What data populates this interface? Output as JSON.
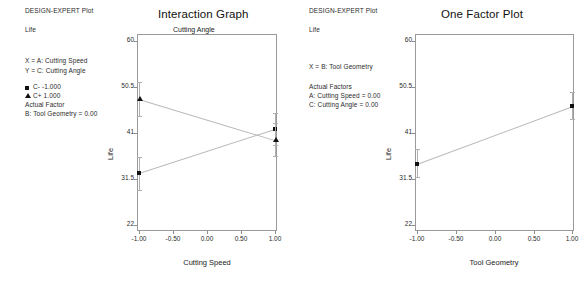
{
  "software": {
    "header_label": "DESIGN-EXPERT Plot",
    "response_label": "Life"
  },
  "left_panel": {
    "header": "DESIGN-EXPERT Plot",
    "response": "Life",
    "x_spec": "X = A: Cutting Speed",
    "y_spec": "Y = C: Cutting Angle",
    "legend": [
      {
        "marker": "square-marker-icon",
        "label": "C- -1.000"
      },
      {
        "marker": "triangle-marker-icon",
        "label": "C+ 1.000"
      }
    ],
    "actual_factor_heading": "Actual Factor",
    "actual_factors": [
      "B: Tool Geometry = 0.00"
    ],
    "title": "Interaction Graph",
    "subtitle": "Cutting Angle",
    "xlabel": "Cutting Speed",
    "ylabel": "Life",
    "yticks": [
      "60",
      "50.5",
      "41",
      "31.5",
      "22"
    ],
    "xticks": [
      "-1.00",
      "-0.50",
      "0.00",
      "0.50",
      "1.00"
    ]
  },
  "right_panel": {
    "header": "DESIGN-EXPERT Plot",
    "response": "Life",
    "x_spec": "X = B: Tool Geometry",
    "actual_factor_heading": "Actual Factors",
    "actual_factors": [
      "A: Cutting Speed = 0.00",
      "C: Cutting Angle = 0.00"
    ],
    "title": "One Factor Plot",
    "xlabel": "Tool Geometry",
    "ylabel": "Life",
    "yticks": [
      "60",
      "50.5",
      "41",
      "31.5",
      "22"
    ],
    "xticks": [
      "-1.00",
      "-0.50",
      "0.00",
      "0.50",
      "1.00"
    ]
  },
  "chart_data": [
    {
      "type": "line",
      "title": "Interaction Graph",
      "subtitle": "Cutting Angle",
      "xlabel": "Cutting Speed",
      "ylabel": "Life",
      "xlim": [
        -1.0,
        1.0
      ],
      "ylim": [
        22,
        60
      ],
      "yticks": [
        60,
        50.5,
        41,
        31.5,
        22
      ],
      "xticks": [
        -1.0,
        -0.5,
        0.0,
        0.5,
        1.0
      ],
      "grid": false,
      "legend_position": "outside-left",
      "x": [
        -1.0,
        1.0
      ],
      "series": [
        {
          "name": "C- -1.000",
          "marker": "square",
          "values": [
            32.7,
            41.8
          ],
          "err_low": [
            29.3,
            38.5
          ],
          "err_high": [
            36.1,
            45.2
          ]
        },
        {
          "name": "C+ 1.000",
          "marker": "triangle",
          "values": [
            48.1,
            39.6
          ],
          "err_low": [
            44.6,
            36.2
          ],
          "err_high": [
            51.6,
            43.1
          ]
        }
      ]
    },
    {
      "type": "line",
      "title": "One Factor Plot",
      "xlabel": "Tool Geometry",
      "ylabel": "Life",
      "xlim": [
        -1.0,
        1.0
      ],
      "ylim": [
        22,
        60
      ],
      "yticks": [
        60,
        50.5,
        41,
        31.5,
        22
      ],
      "xticks": [
        -1.0,
        -0.5,
        0.0,
        0.5,
        1.0
      ],
      "grid": false,
      "legend_position": "none",
      "x": [
        -1.0,
        1.0
      ],
      "series": [
        {
          "name": "Life",
          "marker": "square",
          "values": [
            34.7,
            46.6
          ],
          "err_low": [
            31.9,
            43.8
          ],
          "err_high": [
            37.6,
            49.5
          ]
        }
      ]
    }
  ]
}
